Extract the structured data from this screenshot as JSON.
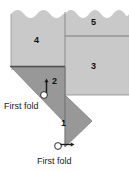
{
  "figure": {
    "colors": {
      "paper_light": "#c9c9c9",
      "paper_dark": "#989898",
      "outline": "#6f6f6f",
      "fold_line": "#555555",
      "arrow": "#1a1a1a",
      "text": "#1a1a1a",
      "background": "#ffffff"
    },
    "regions": [
      {
        "id": "region-1",
        "label": "1",
        "shade": "dark"
      },
      {
        "id": "region-2",
        "label": "2",
        "shade": "dark"
      },
      {
        "id": "region-3",
        "label": "3",
        "shade": "light"
      },
      {
        "id": "region-4",
        "label": "4",
        "shade": "light"
      },
      {
        "id": "region-5",
        "label": "5",
        "shade": "light"
      }
    ],
    "annotations": [
      {
        "id": "first-fold-upper",
        "text": "First fold"
      },
      {
        "id": "first-fold-lower",
        "text": "First fold"
      }
    ],
    "edges": {
      "top_edge_style": "torn-scalloped"
    }
  }
}
